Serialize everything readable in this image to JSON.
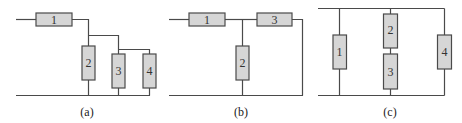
{
  "figure": {
    "colors": {
      "wire": "#4a4a4a",
      "resistor_fill": "#d6d6d6",
      "resistor_stroke": "#4a4a4a",
      "background": "#ffffff"
    },
    "panels": [
      {
        "id": "a",
        "caption": "(a)",
        "resistors": [
          {
            "label": "1",
            "orientation": "horizontal"
          },
          {
            "label": "2",
            "orientation": "vertical"
          },
          {
            "label": "3",
            "orientation": "vertical"
          },
          {
            "label": "4",
            "orientation": "vertical"
          }
        ],
        "topology": "1 in series with (2 parallel with (3 parallel 4))"
      },
      {
        "id": "b",
        "caption": "(b)",
        "resistors": [
          {
            "label": "1",
            "orientation": "horizontal"
          },
          {
            "label": "2",
            "orientation": "vertical"
          },
          {
            "label": "3",
            "orientation": "horizontal"
          }
        ],
        "topology": "1 in series with (2 parallel 3)"
      },
      {
        "id": "c",
        "caption": "(c)",
        "resistors": [
          {
            "label": "1",
            "orientation": "vertical"
          },
          {
            "label": "2",
            "orientation": "vertical"
          },
          {
            "label": "3",
            "orientation": "vertical"
          },
          {
            "label": "4",
            "orientation": "vertical"
          }
        ],
        "topology": "1 parallel (2 series 3) parallel 4"
      }
    ]
  }
}
